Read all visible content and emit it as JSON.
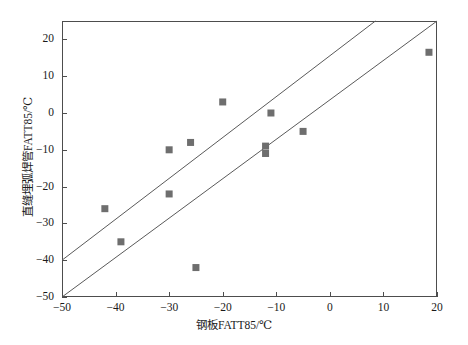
{
  "chart_data": {
    "type": "scatter",
    "title": "",
    "xlabel": "钢板FATT85/℃",
    "ylabel": "直缝埋弧焊管FATT85/℃",
    "xlim": [
      -50,
      20
    ],
    "ylim": [
      -50,
      25
    ],
    "xticks": [
      -50,
      -40,
      -30,
      -20,
      -10,
      0,
      10,
      20
    ],
    "yticks": [
      20,
      10,
      0,
      -10,
      -20,
      -30,
      -40,
      -50
    ],
    "xticklabels": [
      "−50",
      "−40",
      "−30",
      "−20",
      "−10",
      "0",
      "10",
      "20"
    ],
    "yticklabels": [
      "20",
      "10",
      "0",
      "−10",
      "−20",
      "−30",
      "−40",
      "−50"
    ],
    "grid": false,
    "legend": null,
    "marker": "square",
    "marker_color": "#6e6e6e",
    "marker_size": 7,
    "line_color": "#5a5a5a",
    "points": [
      {
        "x": -42,
        "y": -26
      },
      {
        "x": -39,
        "y": -35
      },
      {
        "x": -30,
        "y": -10
      },
      {
        "x": -30,
        "y": -22
      },
      {
        "x": -26,
        "y": -8
      },
      {
        "x": -25,
        "y": -42
      },
      {
        "x": -20,
        "y": 3
      },
      {
        "x": -12,
        "y": -9
      },
      {
        "x": -12,
        "y": -11
      },
      {
        "x": -11,
        "y": 0
      },
      {
        "x": -5,
        "y": -5
      },
      {
        "x": 18.5,
        "y": 16.5
      }
    ],
    "reference_lines": [
      {
        "name": "upper-bound-line",
        "x1": -50,
        "y1": -40,
        "x2": 8.5,
        "y2": 25
      },
      {
        "name": "lower-bound-line",
        "x1": -50,
        "y1": -50,
        "x2": 20,
        "y2": 25
      }
    ]
  },
  "figure": {
    "background": "#ffffff",
    "frame_color": "#4d4d4d"
  }
}
